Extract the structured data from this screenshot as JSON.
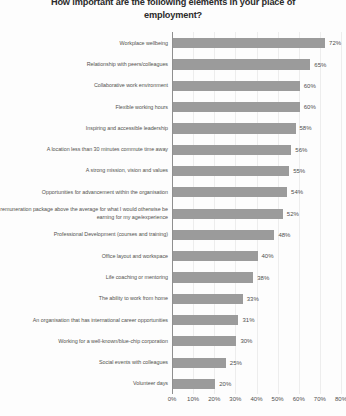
{
  "chart_data": {
    "type": "bar",
    "orientation": "horizontal",
    "title": "How important are the following elements in your place of employment?",
    "xlabel": "",
    "ylabel": "",
    "xlim": [
      0,
      80
    ],
    "grid": true,
    "legend": false,
    "value_suffix": "%",
    "bar_color": "#9b9b9b",
    "tick_labels": [
      "0%",
      "10%",
      "20%",
      "30%",
      "40%",
      "50%",
      "60%",
      "70%",
      "80%"
    ],
    "ticks": [
      0,
      10,
      20,
      30,
      40,
      50,
      60,
      70,
      80
    ],
    "categories": [
      "Workplace wellbeing",
      "Relationship with peers/colleagues",
      "Collaborative work environment",
      "Flexible working hours",
      "Inspiring and accessible leadership",
      "A location less than 30 minutes commute time away",
      "A strong mission, vision and values",
      "Opportunities for advancement within the organisation",
      "A remuneration package above the average for what I would otherwise be earning for my age/experience",
      "Professional Development (courses and training)",
      "Office layout and workspace",
      "Life coaching or mentoring",
      "The ability to work from home",
      "An organisation that has international career opportunities",
      "Working for a well-known/blue-chip corporation",
      "Social events with colleagues",
      "Volunteer days"
    ],
    "values": [
      72,
      65,
      60,
      60,
      58,
      56,
      55,
      54,
      52,
      48,
      40,
      38,
      33,
      31,
      30,
      25,
      20
    ],
    "value_labels": [
      "72%",
      "65%",
      "60%",
      "60%",
      "58%",
      "56%",
      "55%",
      "54%",
      "52%",
      "48%",
      "40%",
      "38%",
      "33%",
      "31%",
      "30%",
      "25%",
      "20%"
    ]
  }
}
